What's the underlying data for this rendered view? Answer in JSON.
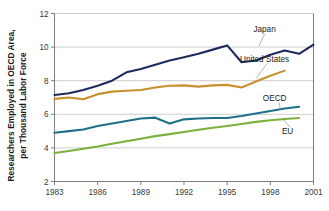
{
  "chart_data": {
    "type": "line",
    "title": "",
    "xlabel": "",
    "ylabel": "Researchers Employed in OECD Area, per Thousand Labor Force",
    "ylabel_line1": "Researchers Employed in OECD Area,",
    "ylabel_line2": "per Thousand Labor Force",
    "xlim": [
      1983,
      2001
    ],
    "ylim": [
      2,
      12
    ],
    "ytick_labels": [
      "2",
      "4",
      "6",
      "8",
      "10",
      "12"
    ],
    "ytick_values": [
      2,
      4,
      6,
      8,
      10,
      12
    ],
    "xtick_labels": [
      "1983",
      "1986",
      "1989",
      "1992",
      "1995",
      "1998",
      "2001"
    ],
    "xtick_values": [
      1983,
      1986,
      1989,
      1992,
      1995,
      1998,
      2001
    ],
    "grid": "horizontal",
    "legend_position": "inline-right-annotations",
    "series": [
      {
        "name": "Japan",
        "color": "#1c2a5e",
        "x": [
          1983,
          1984,
          1985,
          1986,
          1987,
          1988,
          1989,
          1990,
          1991,
          1992,
          1993,
          1994,
          1995,
          1996,
          1997,
          1998,
          1999,
          2000,
          2001
        ],
        "values": [
          7.15,
          7.25,
          7.45,
          7.7,
          8.0,
          8.5,
          8.7,
          8.95,
          9.2,
          9.4,
          9.6,
          9.85,
          10.1,
          9.1,
          9.2,
          9.55,
          9.8,
          9.6,
          10.15
        ],
        "label_x": 1997.6,
        "label_y": 11.05
      },
      {
        "name": "United States",
        "color": "#c8902c",
        "x": [
          1983,
          1984,
          1985,
          1986,
          1987,
          1988,
          1989,
          1990,
          1991,
          1992,
          1993,
          1994,
          1995,
          1996,
          1997,
          1998,
          1999
        ],
        "values": [
          6.92,
          7.0,
          6.9,
          7.2,
          7.35,
          7.4,
          7.45,
          7.6,
          7.7,
          7.72,
          7.65,
          7.72,
          7.75,
          7.6,
          7.95,
          8.3,
          8.6
        ],
        "label_x": 1997.6,
        "label_y": 9.3
      },
      {
        "name": "OECD",
        "color": "#1e7088",
        "x": [
          1983,
          1984,
          1985,
          1986,
          1987,
          1988,
          1989,
          1990,
          1991,
          1992,
          1993,
          1994,
          1995,
          1996,
          1997,
          1998,
          1999,
          2000
        ],
        "values": [
          4.9,
          5.0,
          5.1,
          5.3,
          5.45,
          5.6,
          5.75,
          5.8,
          5.45,
          5.7,
          5.75,
          5.78,
          5.78,
          5.9,
          6.05,
          6.2,
          6.35,
          6.45
        ],
        "label_x": 1998.3,
        "label_y": 6.95
      },
      {
        "name": "EU",
        "color": "#7cb03c",
        "x": [
          1983,
          1984,
          1985,
          1986,
          1987,
          1988,
          1989,
          1990,
          1991,
          1992,
          1993,
          1994,
          1995,
          1996,
          1997,
          1998,
          1999,
          2000
        ],
        "values": [
          3.7,
          3.82,
          3.95,
          4.08,
          4.25,
          4.4,
          4.55,
          4.7,
          4.82,
          4.95,
          5.08,
          5.2,
          5.3,
          5.42,
          5.55,
          5.65,
          5.72,
          5.78
        ],
        "label_x": 1999.2,
        "label_y": 5.0
      }
    ]
  }
}
